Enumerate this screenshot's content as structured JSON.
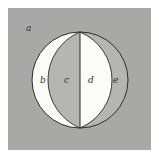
{
  "diagram": {
    "labels": {
      "a": "a",
      "b": "b",
      "c": "c",
      "d": "d",
      "e": "e"
    },
    "colors": {
      "background": "#a8a8a6",
      "white_region": "#fbfbf8",
      "gray_region": "#b5b5b2",
      "stroke": "#2a2a2a"
    }
  }
}
